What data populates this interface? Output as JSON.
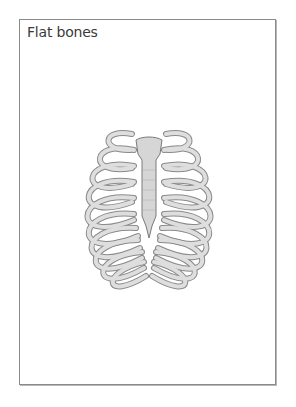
{
  "card": {
    "title": "Flat bones"
  },
  "illustration": {
    "subject": "rib cage with sternum",
    "icon": "ribcage-illustration",
    "colors": {
      "bone": "#d9d9d9",
      "outline": "#7a7a7a",
      "cartilage": "#bdbdbd"
    }
  }
}
